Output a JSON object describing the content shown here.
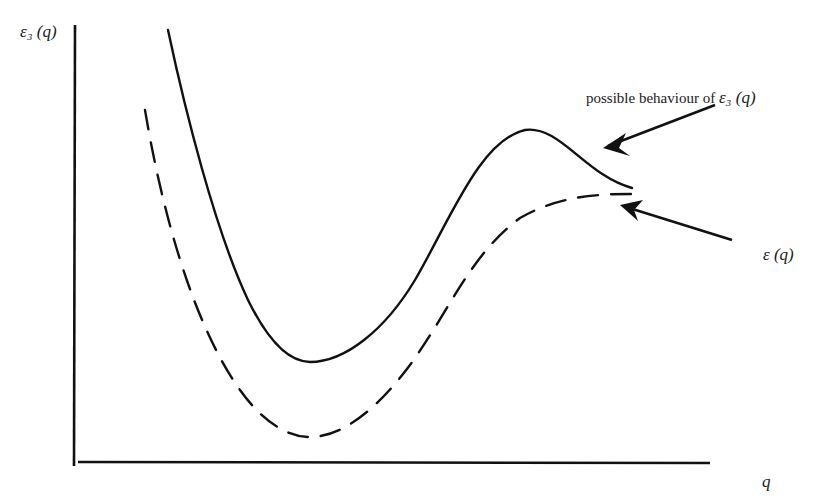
{
  "figure": {
    "type": "sketch",
    "y_axis_label": "ε₃ (q)",
    "x_axis_label": "q",
    "annotations": [
      {
        "text": "possible behaviour of",
        "symbol": "ε₃ (q)",
        "points_to": "solid-curve"
      },
      {
        "text": "ε (q)",
        "points_to": "dashed-curve"
      }
    ],
    "curves": [
      {
        "name": "possible-behaviour",
        "style": "solid",
        "color": "#111111",
        "shape": "steep decay, minimum, rise to local maximum, slight drop"
      },
      {
        "name": "epsilon-q",
        "style": "dashed",
        "color": "#111111",
        "shape": "steep decay, minimum, monotone rise to plateau"
      }
    ],
    "colors": {
      "ink": "#111111",
      "background": "#ffffff"
    }
  },
  "labels": {
    "y": "ε₃ (q)",
    "x": "q",
    "annot1_text": "possible behaviour of ",
    "annot1_symbol": "ε₃ (q)",
    "annot2": "ε (q)"
  }
}
